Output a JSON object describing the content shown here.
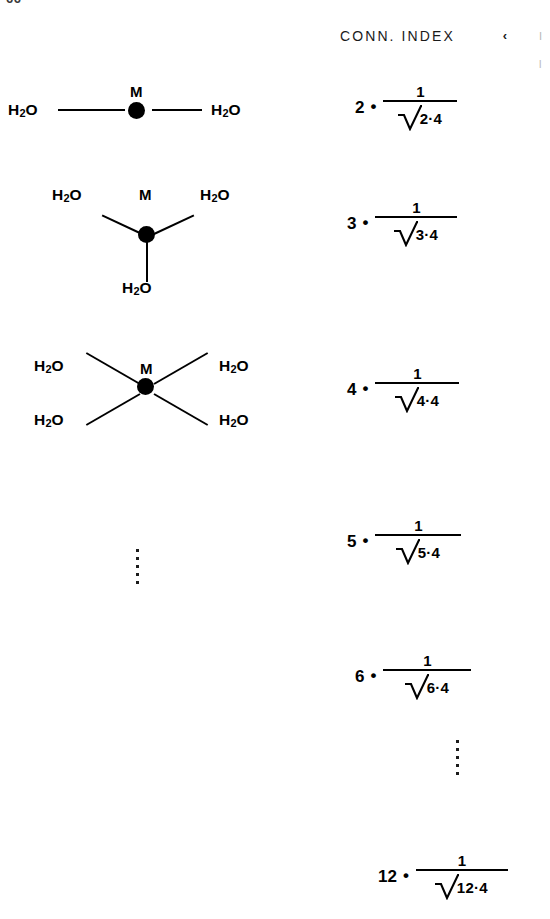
{
  "page": {
    "number_fragment": "66",
    "background_color": "#ffffff",
    "ink_color": "#000000"
  },
  "edge_fragments": {
    "caret_glyph": "‹",
    "clipped_marks": [
      "I",
      "l"
    ]
  },
  "left_column": {
    "label": "coordination-structures",
    "structures": [
      {
        "id": "structure-coord-2",
        "coordination_number": 2,
        "geometry": "linear",
        "metal_label": "M",
        "ligand_label": "H2O",
        "ligand_count": 2,
        "ligands": [
          "H2O",
          "H2O"
        ]
      },
      {
        "id": "structure-coord-3",
        "coordination_number": 3,
        "geometry": "trigonal-planar",
        "metal_label": "M",
        "ligand_label": "H2O",
        "ligand_count": 3,
        "ligands": [
          "H2O",
          "H2O",
          "H2O"
        ]
      },
      {
        "id": "structure-coord-4",
        "coordination_number": 4,
        "geometry": "tetrahedral-cross",
        "metal_label": "M",
        "ligand_label": "H2O",
        "ligand_count": 4,
        "ligands": [
          "H2O",
          "H2O",
          "H2O",
          "H2O"
        ]
      }
    ],
    "continuation_ellipsis": {
      "id": "structures-ellipsis",
      "dot_count": 5,
      "meaning": "continues"
    }
  },
  "right_column": {
    "header": "CONN. INDEX",
    "formula_pattern": "n · 1 / sqrt(n · 4)",
    "numerator_text": "1",
    "multiplication_dot": "•",
    "entries": [
      {
        "id": "conn-index-2",
        "coefficient": "2",
        "numerator": "1",
        "radicand": "2·4",
        "n": 2,
        "value": "2 · 1/√(2·4)"
      },
      {
        "id": "conn-index-3",
        "coefficient": "3",
        "numerator": "1",
        "radicand": "3·4",
        "n": 3,
        "value": "3 · 1/√(3·4)"
      },
      {
        "id": "conn-index-4",
        "coefficient": "4",
        "numerator": "1",
        "radicand": "4·4",
        "n": 4,
        "value": "4 · 1/√(4·4)"
      },
      {
        "id": "conn-index-5",
        "coefficient": "5",
        "numerator": "1",
        "radicand": "5·4",
        "n": 5,
        "value": "5 · 1/√(5·4)"
      },
      {
        "id": "conn-index-6",
        "coefficient": "6",
        "numerator": "1",
        "radicand": "6·4",
        "n": 6,
        "value": "6 · 1/√(6·4)"
      },
      {
        "id": "conn-index-12",
        "coefficient": "12",
        "numerator": "1",
        "radicand": "12·4",
        "n": 12,
        "value": "12 · 1/√(12·4)"
      }
    ],
    "continuation_ellipsis": {
      "id": "formulas-ellipsis",
      "dot_count": 5,
      "meaning": "continues"
    }
  }
}
